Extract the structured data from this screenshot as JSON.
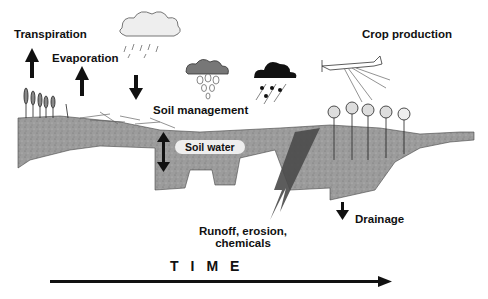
{
  "labels": {
    "transpiration": "Transpiration",
    "evaporation": "Evaporation",
    "soil_management": "Soil management",
    "soil_water": "Soil water",
    "crop_production": "Crop production",
    "runoff_line1": "Runoff, erosion,",
    "runoff_line2": "chemicals",
    "drainage": "Drainage",
    "time_axis": "TIME"
  },
  "icons": [
    "up-arrow",
    "down-arrow",
    "light-rain-cloud",
    "gray-raindrop-cloud",
    "dark-storm-cloud",
    "crop-duster-plane",
    "corn-plants",
    "crop-residue",
    "double-arrow",
    "runoff-arrow",
    "time-arrow"
  ],
  "colors": {
    "soil": "#9a9a9a",
    "soil_dark": "#555555",
    "runoff": "#4a4a4a",
    "text": "#111111"
  }
}
